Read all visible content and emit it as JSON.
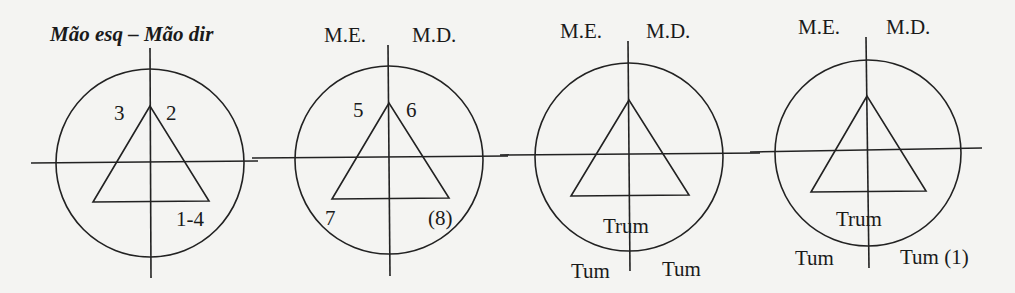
{
  "title": "Mão esq – Mão dir",
  "diagrams": [
    {
      "id": "1",
      "header_left": "",
      "header_right": "",
      "labels": {
        "apex_left": "3",
        "apex_right": "2",
        "base_left": "",
        "base_right": "1-4",
        "below_center": "",
        "bottom_left": "",
        "bottom_right": ""
      },
      "circle": {
        "cx": 150,
        "cy": 163,
        "r": 94
      },
      "vline": {
        "x": 150,
        "y1": 48,
        "y2": 278
      },
      "hline": {
        "y": 162,
        "x1": 31,
        "x2": 258
      },
      "triangle": {
        "apex": [
          150,
          106
        ],
        "left": [
          93,
          202
        ],
        "right": [
          209,
          201
        ]
      }
    },
    {
      "id": "2",
      "header_left": "M.E.",
      "header_right": "M.D.",
      "labels": {
        "apex_left": "5",
        "apex_right": "6",
        "base_left": "7",
        "base_right": "(8)",
        "below_center": "",
        "bottom_left": "",
        "bottom_right": ""
      },
      "circle": {
        "cx": 389,
        "cy": 160,
        "r": 94
      },
      "vline": {
        "x": 389,
        "y1": 45,
        "y2": 276
      },
      "hline": {
        "y": 157,
        "x1": 252,
        "x2": 508
      },
      "triangle": {
        "apex": [
          389,
          103
        ],
        "left": [
          332,
          199
        ],
        "right": [
          449,
          198
        ]
      }
    },
    {
      "id": "3",
      "header_left": "M.E.",
      "header_right": "M.D.",
      "labels": {
        "apex_left": "",
        "apex_right": "",
        "base_left": "",
        "base_right": "",
        "below_center": "Trum",
        "bottom_left": "Tum",
        "bottom_right": "Tum"
      },
      "circle": {
        "cx": 629,
        "cy": 157,
        "r": 94
      },
      "vline": {
        "x": 629,
        "y1": 41,
        "y2": 271
      },
      "hline": {
        "y": 154,
        "x1": 500,
        "x2": 760
      },
      "triangle": {
        "apex": [
          629,
          100
        ],
        "left": [
          571,
          196
        ],
        "right": [
          689,
          195
        ]
      }
    },
    {
      "id": "4",
      "header_left": "M.E.",
      "header_right": "M.D.",
      "labels": {
        "apex_left": "",
        "apex_right": "",
        "base_left": "",
        "base_right": "",
        "below_center": "Trum",
        "bottom_left": "Tum",
        "bottom_right": "Tum (1)"
      },
      "circle": {
        "cx": 868,
        "cy": 153,
        "r": 93
      },
      "vline": {
        "x": 867,
        "y1": 37,
        "y2": 268
      },
      "hline": {
        "y": 150,
        "x1": 750,
        "x2": 982
      },
      "triangle": {
        "apex": [
          867,
          96
        ],
        "left": [
          811,
          192
        ],
        "right": [
          926,
          191
        ]
      }
    }
  ]
}
